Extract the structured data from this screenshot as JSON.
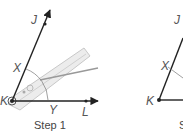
{
  "steps": [
    {
      "caption": "Step 1",
      "labels": {
        "J": "J",
        "X": "X",
        "K": "K",
        "Y": "Y",
        "L": "L"
      },
      "tool": "compass"
    },
    {
      "caption": "Step 2",
      "labels": {
        "X": "X",
        "K": "K",
        "J": "J"
      }
    }
  ],
  "colors": {
    "line": "#222222",
    "label": "#555555",
    "compass": "#d8d8d8"
  }
}
